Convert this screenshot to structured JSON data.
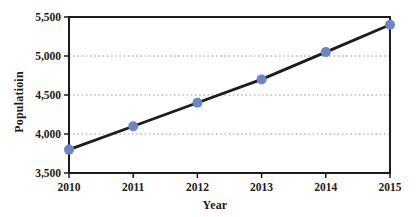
{
  "figure": {
    "background_color": "#ffffff"
  },
  "chart_data": {
    "type": "line",
    "title": "",
    "xlabel": "Year",
    "ylabel": "Populatioin",
    "x": [
      2010,
      2011,
      2012,
      2013,
      2014,
      2015
    ],
    "x_tick_labels": [
      "2010",
      "2011",
      "2012",
      "2013",
      "2014",
      "2015"
    ],
    "series": [
      {
        "name": "Population",
        "values": [
          3800,
          4100,
          4400,
          4700,
          5050,
          5400
        ]
      }
    ],
    "ylim": [
      3500,
      5500
    ],
    "y_ticks": [
      3500,
      4000,
      4500,
      5000,
      5500
    ],
    "y_tick_labels": [
      "3,500",
      "4,000",
      "4,500",
      "5,000",
      "5,500"
    ],
    "gridline_values": [
      4000,
      4500,
      5000
    ],
    "grid_style": "dotted-horizontal",
    "legend": "none",
    "colors": {
      "line": "#1c1c1c",
      "marker": "#6b86c8",
      "frame": "#1c1c1c",
      "grid": "#9a9a9a",
      "text": "#1c1c1c"
    },
    "marker_radius": 5
  }
}
